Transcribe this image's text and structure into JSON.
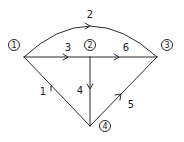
{
  "diagram": {
    "type": "directed-graph",
    "stroke_color": "#2a2a2a",
    "nodes": [
      {
        "id": "1",
        "label": "1",
        "junction": [
          24,
          57
        ],
        "label_pos": [
          14,
          45
        ]
      },
      {
        "id": "2",
        "label": "2",
        "junction": [
          90,
          57
        ],
        "label_pos": [
          90,
          45
        ]
      },
      {
        "id": "3",
        "label": "3",
        "junction": [
          157,
          57
        ],
        "label_pos": [
          167,
          45
        ]
      },
      {
        "id": "4",
        "label": "4",
        "junction": [
          90,
          126
        ],
        "label_pos": [
          105,
          126
        ]
      }
    ],
    "edges": [
      {
        "id": "1",
        "label": "1",
        "from": "4",
        "to": "1",
        "label_pos": [
          43,
          92
        ]
      },
      {
        "id": "2",
        "label": "2",
        "from": "1",
        "to": "3",
        "curved": true,
        "label_pos": [
          90,
          17
        ]
      },
      {
        "id": "3",
        "label": "3",
        "from": "1",
        "to": "2",
        "label_pos": [
          68,
          50
        ]
      },
      {
        "id": "4",
        "label": "4",
        "from": "2",
        "to": "4",
        "label_pos": [
          80,
          93
        ]
      },
      {
        "id": "5",
        "label": "5",
        "from": "4",
        "to": "3",
        "label_pos": [
          131,
          107
        ]
      },
      {
        "id": "6",
        "label": "6",
        "from": "2",
        "to": "3",
        "label_pos": [
          126,
          50
        ]
      }
    ]
  }
}
